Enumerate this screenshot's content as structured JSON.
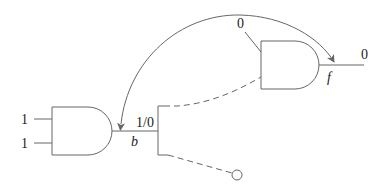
{
  "diagram": {
    "type": "logic-circuit",
    "gate_lower": {
      "kind": "AND",
      "input_values": [
        "1",
        "1"
      ]
    },
    "stem": {
      "name": "b",
      "value": "1/0"
    },
    "gate_upper": {
      "kind": "AND",
      "input_value": "0",
      "output_name": "f",
      "output_value": "0"
    },
    "branches": [
      {
        "to": "gate_upper",
        "style": "dashed"
      },
      {
        "to": "open-terminal",
        "style": "dashed"
      }
    ],
    "arc": {
      "description": "bidirectional curved arrow between stem b and output f"
    }
  }
}
